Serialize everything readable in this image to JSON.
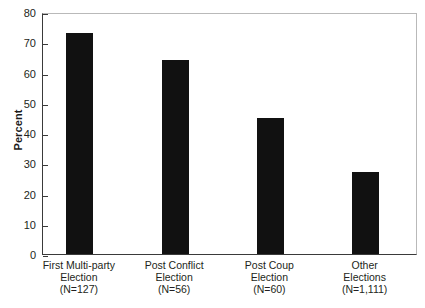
{
  "chart_data": {
    "type": "bar",
    "title": "",
    "xlabel": "",
    "ylabel": "Percent",
    "ylim": [
      0,
      80
    ],
    "ytick_step": 10,
    "yticks": [
      80,
      70,
      60,
      50,
      40,
      30,
      20,
      10,
      0
    ],
    "grid": false,
    "legend": null,
    "categories": [
      "First Multi-party Election (N=127)",
      "Post Conflict Election (N=56)",
      "Post Coup Election (N=60)",
      "Other Elections (N=1,111)"
    ],
    "category_lines": [
      [
        "First Multi-party",
        "Election",
        "(N=127)"
      ],
      [
        "Post Conflict",
        "Election",
        "(N=56)"
      ],
      [
        "Post Coup",
        "Election",
        "(N=60)"
      ],
      [
        "Other",
        "Elections",
        "(N=1,111)"
      ]
    ],
    "values": [
      73,
      64,
      45,
      27
    ],
    "bar_color": "#111111",
    "axis_color": "#3a3a3a",
    "frame_color": "#b9b9b9"
  }
}
